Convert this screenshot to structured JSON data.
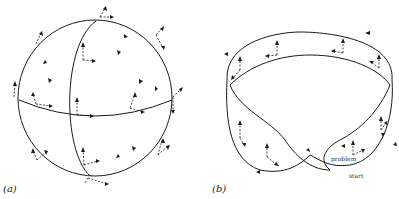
{
  "panels": {
    "a": {
      "label": "(a)",
      "shape": "sphere",
      "description": "Sphere with meridian and equator; dashed parallel-transport frame arrows over surface"
    },
    "b": {
      "label": "(b)",
      "shape": "mobius-strip",
      "description": "Möbius-like band with dashed frame arrows along surface",
      "annotations": {
        "problem": "problem",
        "start": "start"
      }
    }
  },
  "colors": {
    "stroke": "#1a1a1a",
    "background": "#ffffff"
  }
}
